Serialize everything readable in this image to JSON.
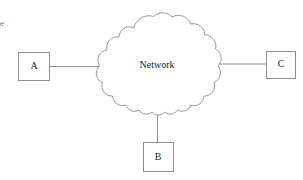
{
  "diagram": {
    "type": "network-topology",
    "title": "Network",
    "background_color": "#ffffff",
    "stroke_color": "#8d8d8d",
    "text_color": "#1a1a1a",
    "cloud": {
      "label": "Network",
      "center_x": 157,
      "center_y": 65,
      "left_x": 99,
      "right_x": 218,
      "top_y": 13,
      "bottom_y": 110
    },
    "nodes": [
      {
        "id": "A",
        "label": "A",
        "x": 18,
        "y": 52,
        "width": 32,
        "height": 29,
        "label_x": 34,
        "label_y": 67
      },
      {
        "id": "B",
        "label": "B",
        "x": 143,
        "y": 142,
        "width": 31,
        "height": 30,
        "label_x": 158,
        "label_y": 158
      },
      {
        "id": "C",
        "label": "C",
        "x": 266,
        "y": 51,
        "width": 30,
        "height": 28,
        "label_x": 281,
        "label_y": 65
      }
    ],
    "links": [
      {
        "from": "A",
        "to": "Network",
        "x1": 50,
        "y1": 66,
        "x2": 100,
        "y2": 66
      },
      {
        "from": "Network",
        "to": "C",
        "x1": 217,
        "y1": 64,
        "x2": 266,
        "y2": 64
      },
      {
        "from": "Network",
        "to": "B",
        "x1": 158,
        "y1": 108,
        "x2": 158,
        "y2": 142
      }
    ],
    "margin_glyph": {
      "text": "e",
      "x": 1,
      "y": 23
    }
  }
}
